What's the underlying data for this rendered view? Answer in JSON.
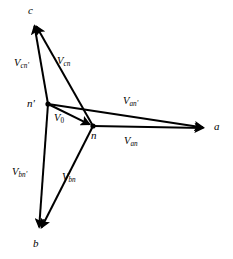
{
  "figure": {
    "background_color": "#ffffff",
    "line_color": "#000000"
  },
  "nodes": [
    {
      "id": "c",
      "label": "c",
      "x": 32,
      "y": 22,
      "label_x": 28,
      "label_y": 5
    },
    {
      "id": "a",
      "label": "a",
      "x": 208,
      "y": 128,
      "label_x": 214,
      "label_y": 121
    },
    {
      "id": "b",
      "label": "b",
      "x": 38,
      "y": 232,
      "label_x": 33,
      "label_y": 238
    },
    {
      "id": "np",
      "label": "n'",
      "x": 48,
      "y": 104,
      "label_x": 27,
      "label_y": 98
    },
    {
      "id": "n",
      "label": "n",
      "x": 93,
      "y": 126,
      "label_x": 91,
      "label_y": 130
    }
  ],
  "vectors": [
    {
      "id": "Vcnp",
      "base": "V",
      "sub": "cn'",
      "from": "np",
      "to": "c",
      "label_x": 14,
      "label_y": 58
    },
    {
      "id": "Vcn",
      "base": "V",
      "sub": "cn",
      "from": "n",
      "to": "c",
      "label_x": 57,
      "label_y": 56
    },
    {
      "id": "Vanp",
      "base": "V",
      "sub": "an'",
      "from": "np",
      "to": "a",
      "label_x": 123,
      "label_y": 96
    },
    {
      "id": "Van",
      "base": "V",
      "sub": "an",
      "from": "n",
      "to": "a",
      "label_x": 124,
      "label_y": 136
    },
    {
      "id": "V0",
      "base": "V",
      "sub": "0",
      "from": "np",
      "to": "n",
      "label_x": 54,
      "label_y": 113
    },
    {
      "id": "Vbnp",
      "base": "V",
      "sub": "bn'",
      "from": "np",
      "to": "b",
      "label_x": 12,
      "label_y": 167
    },
    {
      "id": "Vbn",
      "base": "V",
      "sub": "bn",
      "from": "n",
      "to": "b",
      "label_x": 62,
      "label_y": 172
    }
  ]
}
